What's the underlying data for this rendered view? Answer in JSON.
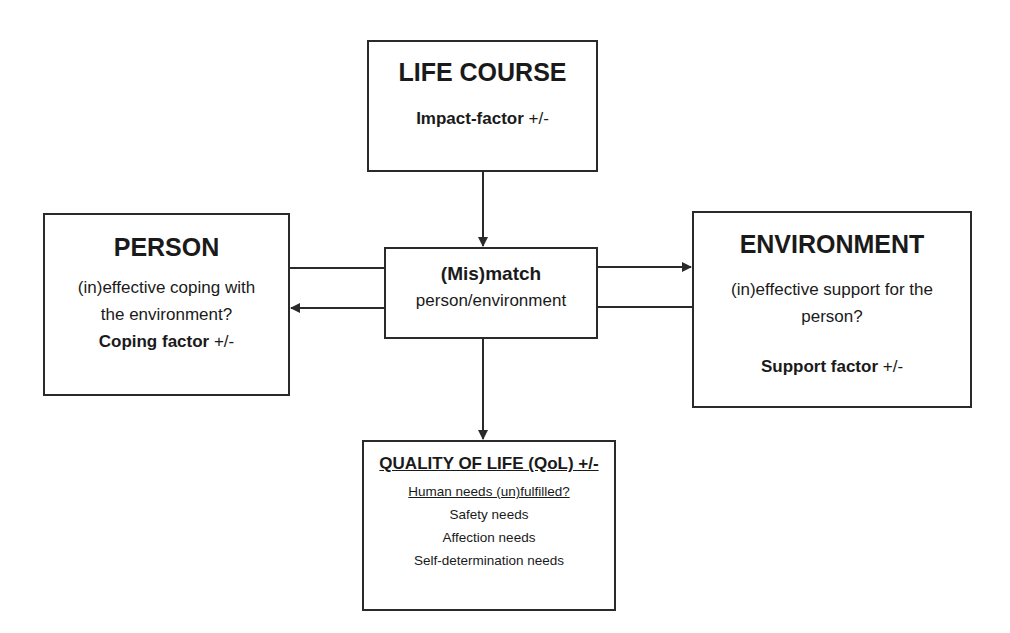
{
  "diagram": {
    "nodes": {
      "life_course": {
        "title": "LIFE COURSE",
        "factor_bold": "Impact-factor",
        "factor_sign": " +/-"
      },
      "person": {
        "title": "PERSON",
        "lines": [
          "(in)effective coping with",
          "the environment?"
        ],
        "factor_bold": "Coping factor",
        "factor_sign": " +/-"
      },
      "mismatch": {
        "title": "(Mis)match",
        "subtitle": "person/environment"
      },
      "environment": {
        "title": "ENVIRONMENT",
        "lines": [
          "(in)effective support for the",
          "person?"
        ],
        "factor_bold": "Support factor",
        "factor_sign": " +/-"
      },
      "quality_of_life": {
        "title": "QUALITY OF LIFE (QoL) +/-",
        "heading": "Human needs (un)fulfilled?",
        "needs": [
          "Safety needs",
          "Affection needs",
          "Self-determination needs"
        ]
      }
    },
    "edges": [
      {
        "from": "life_course",
        "to": "mismatch",
        "arrow": "down"
      },
      {
        "from": "person",
        "to": "environment",
        "via": "mismatch",
        "arrow": "right"
      },
      {
        "from": "environment",
        "to": "person",
        "via": "mismatch",
        "arrow": "left"
      },
      {
        "from": "mismatch",
        "to": "quality_of_life",
        "arrow": "down"
      }
    ],
    "colors": {
      "stroke": "#2a2a2a",
      "text": "#1a1a1a",
      "background": "#ffffff"
    }
  }
}
